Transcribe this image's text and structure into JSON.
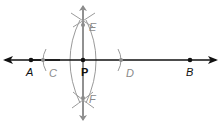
{
  "diagram": {
    "type": "geometric-construction",
    "colors": {
      "main_line": "#111111",
      "construction": "#8c8c8c"
    },
    "points": {
      "A": {
        "label": "A",
        "x": 31,
        "y": 60
      },
      "C": {
        "label": "C",
        "x": 43,
        "y": 60
      },
      "P": {
        "label": "P",
        "x": 83,
        "y": 60
      },
      "D": {
        "label": "D",
        "x": 121,
        "y": 60
      },
      "B": {
        "label": "B",
        "x": 190,
        "y": 60
      },
      "E": {
        "label": "E",
        "x": 83,
        "y": 25
      },
      "F": {
        "label": "F",
        "x": 83,
        "y": 98
      }
    },
    "labels": {
      "A": "A",
      "B": "B",
      "C": "C",
      "D": "D",
      "P": "P",
      "E": "E",
      "F": "F"
    }
  }
}
